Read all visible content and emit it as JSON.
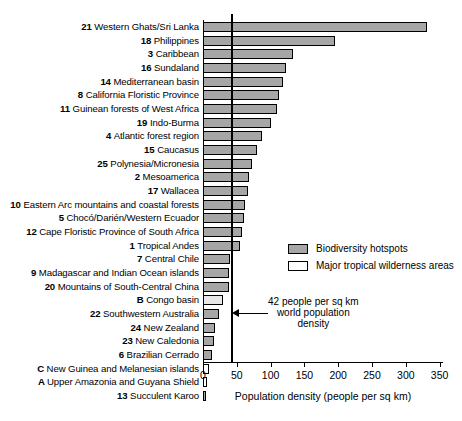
{
  "chart_data": {
    "type": "bar",
    "orientation": "horizontal",
    "title": "",
    "xlabel": "Population density (people per sq km)",
    "ylabel": "",
    "xlim": [
      0,
      355
    ],
    "xticks": [
      0,
      50,
      100,
      150,
      200,
      250,
      300,
      350
    ],
    "grid": false,
    "categories": [
      "21 Western Ghats/Sri Lanka",
      "18 Philippines",
      "3 Caribbean",
      "16 Sundaland",
      "14 Mediterranean basin",
      "8 California Floristic Province",
      "11 Guinean forests of West Africa",
      "19 Indo-Burma",
      "4 Atlantic forest region",
      "15 Caucasus",
      "25 Polynesia/Micronesia",
      "2 Mesoamerica",
      "17 Wallacea",
      "10 Eastern Arc mountains and coastal forests",
      "5 Chocó/Darién/Western Ecuador",
      "12 Cape Floristic Province of South Africa",
      "1 Tropical Andes",
      "7 Central Chile",
      "9 Madagascar and Indian Ocean islands",
      "20 Mountains of South-Central China",
      "B Congo basin",
      "22 Southwestern Australia",
      "24 New Zealand",
      "23 New Caledonia",
      "6 Brazilian Cerrado",
      "C New Guinea and Melanesian islands",
      "A Upper Amazonia and Guyana Shield",
      "13 Succulent Karoo"
    ],
    "values": [
      332,
      195,
      133,
      123,
      119,
      113,
      110,
      100,
      87,
      80,
      73,
      68,
      66,
      62,
      60,
      57,
      54,
      40,
      39,
      38,
      29,
      23,
      18,
      16,
      14,
      9,
      6,
      5
    ],
    "series_group": [
      "hotspot",
      "hotspot",
      "hotspot",
      "hotspot",
      "hotspot",
      "hotspot",
      "hotspot",
      "hotspot",
      "hotspot",
      "hotspot",
      "hotspot",
      "hotspot",
      "hotspot",
      "hotspot",
      "hotspot",
      "hotspot",
      "hotspot",
      "hotspot",
      "hotspot",
      "hotspot",
      "wilderness",
      "hotspot",
      "hotspot",
      "hotspot",
      "hotspot",
      "wilderness",
      "wilderness",
      "hotspot"
    ],
    "legend": {
      "position": "inside-right",
      "entries": [
        {
          "label": "Biodiversity hotspots",
          "group": "hotspot",
          "color": "#a6a6a6"
        },
        {
          "label": "Major tropical wilderness areas",
          "group": "wilderness",
          "color": "#ffffff"
        }
      ]
    },
    "annotations": [
      {
        "name": "world-population-density-reference",
        "value": 42,
        "lines": [
          "42 people per sq km",
          "world population",
          "density"
        ]
      }
    ]
  },
  "colors": {
    "hotspot_fill": "#a6a6a6",
    "wilderness_fill": "#ffffff",
    "outline": "#000000",
    "background": "#ffffff"
  }
}
